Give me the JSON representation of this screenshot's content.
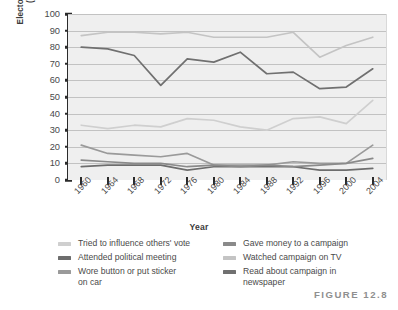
{
  "figure": {
    "caption": "FIGURE 12.8"
  },
  "chart_data": {
    "type": "line",
    "title": "",
    "xlabel": "Year",
    "ylabel": "Electoral Participation (in percent)",
    "ylabel_line1": "Electoral Participation",
    "ylabel_line2": "(in percent)",
    "ylim": [
      0,
      100
    ],
    "ytick_step": 10,
    "yticks": [
      0,
      10,
      20,
      30,
      40,
      50,
      60,
      70,
      80,
      90,
      100
    ],
    "grid": true,
    "grid_axis": "y",
    "legend_position": "below",
    "categories": [
      "1960",
      "1964",
      "1968",
      "1972",
      "1976",
      "1980",
      "1984",
      "1988",
      "1992",
      "1996",
      "2000",
      "2004"
    ],
    "series": [
      {
        "name": "Tried to influence others' vote",
        "color": "#cfcfcf",
        "values": [
          33,
          31,
          33,
          32,
          37,
          36,
          32,
          30,
          37,
          38,
          34,
          48
        ]
      },
      {
        "name": "Attended political meeting",
        "color": "#6d6d6d",
        "values": [
          8,
          9,
          9,
          9,
          6,
          8,
          8,
          8,
          8,
          6,
          6,
          7
        ]
      },
      {
        "name": "Wore button or put sticker on car",
        "color": "#9a9a9a",
        "values": [
          21,
          16,
          15,
          14,
          16,
          9,
          9,
          9,
          11,
          10,
          10,
          21
        ]
      },
      {
        "name": "Gave money to a campaign",
        "color": "#8a8a8a",
        "values": [
          12,
          11,
          10,
          10,
          8,
          9,
          8,
          9,
          8,
          9,
          10,
          13
        ]
      },
      {
        "name": "Watched campaign on TV",
        "color": "#c4c4c4",
        "values": [
          87,
          89,
          89,
          88,
          89,
          86,
          86,
          86,
          89,
          74,
          81,
          86
        ]
      },
      {
        "name": "Read about campaign in newspaper",
        "color": "#707070",
        "values": [
          80,
          79,
          75,
          57,
          73,
          71,
          77,
          64,
          65,
          55,
          56,
          67
        ]
      }
    ]
  },
  "legend": {
    "left_column": [
      {
        "label": "Tried to influence others' vote",
        "continuation": "",
        "color": "#cfcfcf",
        "swatch_name": "legend-swatch-tried-to-influence"
      },
      {
        "label": "Attended political meeting",
        "continuation": "",
        "color": "#6d6d6d",
        "swatch_name": "legend-swatch-attended-meeting"
      },
      {
        "label": "Wore button or put sticker",
        "continuation": "on car",
        "color": "#9a9a9a",
        "swatch_name": "legend-swatch-wore-button"
      }
    ],
    "right_column": [
      {
        "label": "Gave money to a campaign",
        "continuation": "",
        "color": "#8a8a8a",
        "swatch_name": "legend-swatch-gave-money"
      },
      {
        "label": "Watched campaign on TV",
        "continuation": "",
        "color": "#c4c4c4",
        "swatch_name": "legend-swatch-watched-tv"
      },
      {
        "label": "Read about campaign in",
        "continuation": "newspaper",
        "color": "#707070",
        "swatch_name": "legend-swatch-read-newspaper"
      }
    ]
  },
  "colors": {
    "plot_background": "#efefef",
    "gridline": "#9c9c9c",
    "axis": "#2b2b2b",
    "text": "#4a4a4a",
    "caption": "#8f8f8f"
  }
}
